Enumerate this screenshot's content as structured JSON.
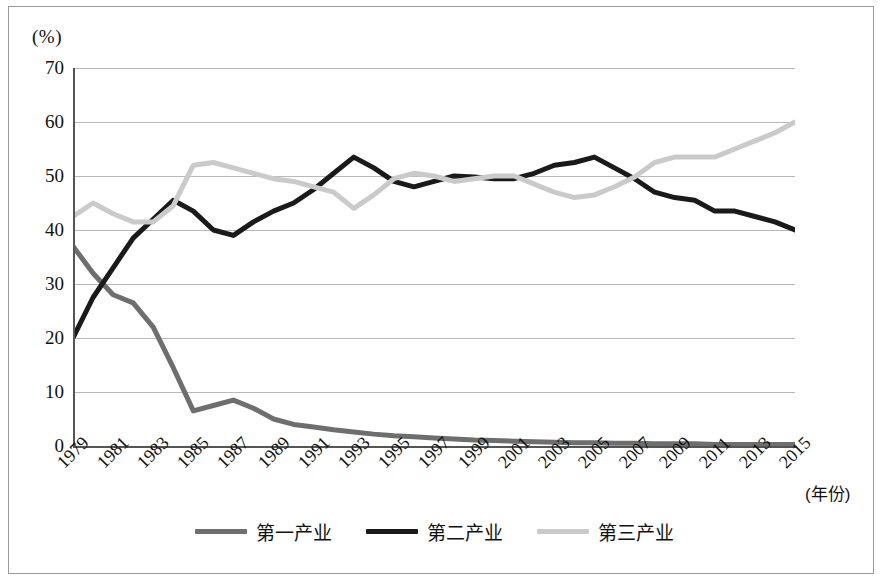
{
  "figure": {
    "unit_label": "(%)",
    "xaxis_title": "(年份)",
    "background": "#ffffff",
    "frame_color": "#9a9a9a"
  },
  "legend": {
    "position": "bottom-center",
    "items": [
      {
        "label": "第一产业",
        "color": "#6e6e6e",
        "key": "primary"
      },
      {
        "label": "第二产业",
        "color": "#1a1a1a",
        "key": "secondary"
      },
      {
        "label": "第三产业",
        "color": "#cacaca",
        "key": "tertiary"
      }
    ]
  },
  "chart_data": {
    "type": "line",
    "title": "",
    "subtitle": "",
    "xlabel": "(年份)",
    "ylabel": "(%)",
    "xlim": [
      1979,
      2015
    ],
    "ylim": [
      0,
      70
    ],
    "ytick_labels": [
      "0",
      "10",
      "20",
      "30",
      "40",
      "50",
      "60",
      "70"
    ],
    "yticks": [
      0,
      10,
      20,
      30,
      40,
      50,
      60,
      70
    ],
    "xtick_labels": [
      "1979",
      "1981",
      "1983",
      "1985",
      "1987",
      "1989",
      "1991",
      "1993",
      "1995",
      "1997",
      "1999",
      "2001",
      "2003",
      "2005",
      "2007",
      "2009",
      "2011",
      "2013",
      "2015"
    ],
    "xticks": [
      1979,
      1981,
      1983,
      1985,
      1987,
      1989,
      1991,
      1993,
      1995,
      1997,
      1999,
      2001,
      2003,
      2005,
      2007,
      2009,
      2011,
      2013,
      2015
    ],
    "grid": "horizontal",
    "legend_position": "bottom",
    "x": [
      1979,
      1980,
      1981,
      1982,
      1983,
      1984,
      1985,
      1986,
      1987,
      1988,
      1989,
      1990,
      1991,
      1992,
      1993,
      1994,
      1995,
      1996,
      1997,
      1998,
      1999,
      2000,
      2001,
      2002,
      2003,
      2004,
      2005,
      2006,
      2007,
      2008,
      2009,
      2010,
      2011,
      2012,
      2013,
      2014,
      2015
    ],
    "series": [
      {
        "name": "第一产业",
        "color": "#6e6e6e",
        "values": [
          37.0,
          32.0,
          28.0,
          26.5,
          22.0,
          14.5,
          6.5,
          7.5,
          8.5,
          7.0,
          5.0,
          4.0,
          3.5,
          3.0,
          2.6,
          2.2,
          1.9,
          1.7,
          1.5,
          1.3,
          1.1,
          1.0,
          0.9,
          0.8,
          0.7,
          0.6,
          0.6,
          0.5,
          0.5,
          0.4,
          0.4,
          0.4,
          0.3,
          0.3,
          0.3,
          0.3,
          0.3
        ]
      },
      {
        "name": "第二产业",
        "color": "#1a1a1a",
        "values": [
          20.0,
          27.5,
          33.0,
          38.5,
          42.0,
          45.5,
          43.5,
          40.0,
          39.0,
          41.5,
          43.5,
          45.0,
          47.5,
          50.5,
          53.5,
          51.5,
          49.0,
          48.0,
          49.0,
          50.0,
          49.8,
          49.5,
          49.5,
          50.5,
          52.0,
          52.5,
          53.5,
          51.5,
          49.5,
          47.0,
          46.0,
          45.5,
          43.5,
          43.5,
          42.5,
          41.5,
          40.0
        ]
      },
      {
        "name": "第三产业",
        "color": "#cacaca",
        "values": [
          42.5,
          45.0,
          43.0,
          41.5,
          41.5,
          44.5,
          52.0,
          52.5,
          51.5,
          50.5,
          49.5,
          49.0,
          48.0,
          47.0,
          44.0,
          46.5,
          49.5,
          50.5,
          50.0,
          49.0,
          49.5,
          50.0,
          50.0,
          48.5,
          47.0,
          46.0,
          46.5,
          48.0,
          49.8,
          52.5,
          53.5,
          53.5,
          53.5,
          55.0,
          56.5,
          58.0,
          60.0
        ]
      }
    ]
  }
}
